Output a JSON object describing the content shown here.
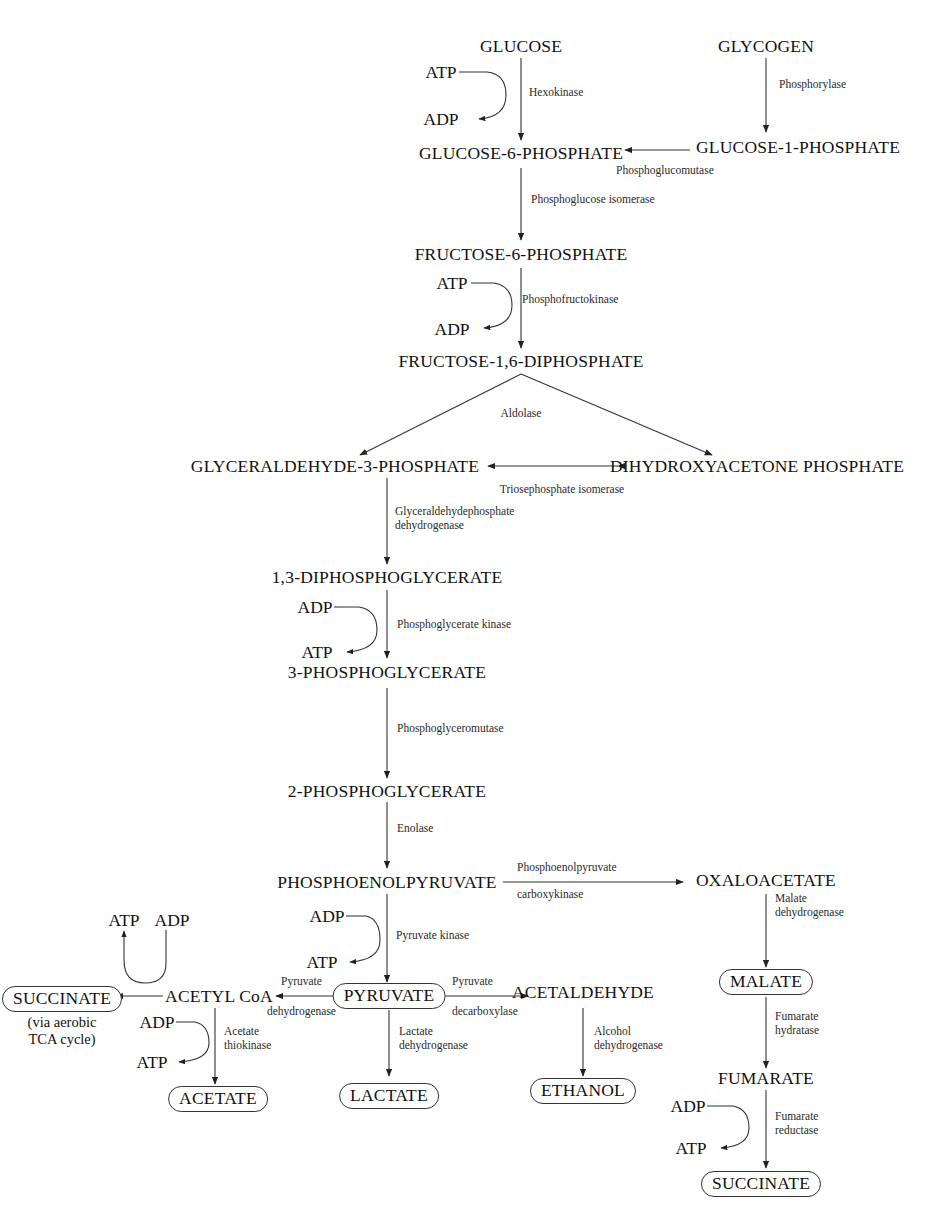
{
  "diagram": {
    "background_color": "#ffffff",
    "line_color": "#333333",
    "text_color": "#111111"
  },
  "metabolites": [
    {
      "id": "glucose",
      "label": "GLUCOSE",
      "boxed": false
    },
    {
      "id": "glycogen",
      "label": "GLYCOGEN",
      "boxed": false
    },
    {
      "id": "g6p",
      "label": "GLUCOSE-6-PHOSPHATE",
      "boxed": false
    },
    {
      "id": "g1p",
      "label": "GLUCOSE-1-PHOSPHATE",
      "boxed": false
    },
    {
      "id": "f6p",
      "label": "FRUCTOSE-6-PHOSPHATE",
      "boxed": false
    },
    {
      "id": "fdp",
      "label": "FRUCTOSE-1,6-DIPHOSPHATE",
      "boxed": false
    },
    {
      "id": "g3p",
      "label": "GLYCERALDEHYDE-3-PHOSPHATE",
      "boxed": false
    },
    {
      "id": "dhap",
      "label": "DIHYDROXYACETONE PHOSPHATE",
      "boxed": false
    },
    {
      "id": "dpg",
      "label": "1,3-DIPHOSPHOGLYCERATE",
      "boxed": false
    },
    {
      "id": "pg3",
      "label": "3-PHOSPHOGLYCERATE",
      "boxed": false
    },
    {
      "id": "pg2",
      "label": "2-PHOSPHOGLYCERATE",
      "boxed": false
    },
    {
      "id": "pep",
      "label": "PHOSPHOENOLPYRUVATE",
      "boxed": false
    },
    {
      "id": "oaa",
      "label": "OXALOACETATE",
      "boxed": false
    },
    {
      "id": "malate",
      "label": "MALATE",
      "boxed": true
    },
    {
      "id": "fumarate",
      "label": "FUMARATE",
      "boxed": false
    },
    {
      "id": "succinate_br",
      "label": "SUCCINATE",
      "boxed": true
    },
    {
      "id": "pyruvate",
      "label": "PYRUVATE",
      "boxed": true
    },
    {
      "id": "acetaldehyde",
      "label": "ACETALDEHYDE",
      "boxed": false
    },
    {
      "id": "ethanol",
      "label": "ETHANOL",
      "boxed": true
    },
    {
      "id": "lactate",
      "label": "LACTATE",
      "boxed": true
    },
    {
      "id": "acetylcoa",
      "label": "ACETYL CoA",
      "boxed": false
    },
    {
      "id": "acetate",
      "label": "ACETATE",
      "boxed": true
    },
    {
      "id": "succinate_tca",
      "label": "SUCCINATE",
      "boxed": true
    }
  ],
  "annotations": {
    "tca_note_line1": "(via aerobic",
    "tca_note_line2": "TCA cycle)"
  },
  "enzymes": [
    {
      "id": "hexokinase",
      "label": "Hexokinase"
    },
    {
      "id": "phosphorylase",
      "label": "Phosphorylase"
    },
    {
      "id": "phosphoglucomutase",
      "label": "Phosphoglucomutase"
    },
    {
      "id": "phosphoglucose_isomerase",
      "label": "Phosphoglucose isomerase"
    },
    {
      "id": "phosphofructokinase",
      "label": "Phosphofructokinase"
    },
    {
      "id": "aldolase",
      "label": "Aldolase"
    },
    {
      "id": "triosephosphate_isomerase",
      "label": "Triosephosphate isomerase"
    },
    {
      "id": "gapdh_line1",
      "label": "Glyceraldehydephosphate"
    },
    {
      "id": "gapdh_line2",
      "label": "dehydrogenase"
    },
    {
      "id": "pgk",
      "label": "Phosphoglycerate kinase"
    },
    {
      "id": "pgm",
      "label": "Phosphoglyceromutase"
    },
    {
      "id": "enolase",
      "label": "Enolase"
    },
    {
      "id": "pepck_line1",
      "label": "Phosphoenolpyruvate"
    },
    {
      "id": "pepck_line2",
      "label": "carboxykinase"
    },
    {
      "id": "pyruvate_kinase",
      "label": "Pyruvate kinase"
    },
    {
      "id": "mdh_line1",
      "label": "Malate"
    },
    {
      "id": "mdh_line2",
      "label": "dehydrogenase"
    },
    {
      "id": "fum_hyd_line1",
      "label": "Fumarate"
    },
    {
      "id": "fum_hyd_line2",
      "label": "hydratase"
    },
    {
      "id": "fum_red_line1",
      "label": "Fumarate"
    },
    {
      "id": "fum_red_line2",
      "label": "reductase"
    },
    {
      "id": "pdh_line1",
      "label": "Pyruvate"
    },
    {
      "id": "pdh_line2",
      "label": "dehydrogenase"
    },
    {
      "id": "pdc_line1",
      "label": "Pyruvate"
    },
    {
      "id": "pdc_line2",
      "label": "decarboxylase"
    },
    {
      "id": "ldh_line1",
      "label": "Lactate"
    },
    {
      "id": "ldh_line2",
      "label": "dehydrogenase"
    },
    {
      "id": "adh_line1",
      "label": "Alcohol"
    },
    {
      "id": "adh_line2",
      "label": "dehydrogenase"
    },
    {
      "id": "acetate_thio_line1",
      "label": "Acetate"
    },
    {
      "id": "acetate_thio_line2",
      "label": "thiokinase"
    }
  ],
  "cofactors": [
    {
      "id": "atp_hexo",
      "label": "ATP"
    },
    {
      "id": "adp_hexo",
      "label": "ADP"
    },
    {
      "id": "atp_pfk",
      "label": "ATP"
    },
    {
      "id": "adp_pfk",
      "label": "ADP"
    },
    {
      "id": "adp_pgk",
      "label": "ADP"
    },
    {
      "id": "atp_pgk",
      "label": "ATP"
    },
    {
      "id": "adp_pk",
      "label": "ADP"
    },
    {
      "id": "atp_pk",
      "label": "ATP"
    },
    {
      "id": "atp_coa",
      "label": "ATP"
    },
    {
      "id": "adp_coa",
      "label": "ADP"
    },
    {
      "id": "adp_acetate",
      "label": "ADP"
    },
    {
      "id": "atp_acetate",
      "label": "ATP"
    },
    {
      "id": "adp_fumred",
      "label": "ADP"
    },
    {
      "id": "atp_fumred",
      "label": "ATP"
    }
  ]
}
